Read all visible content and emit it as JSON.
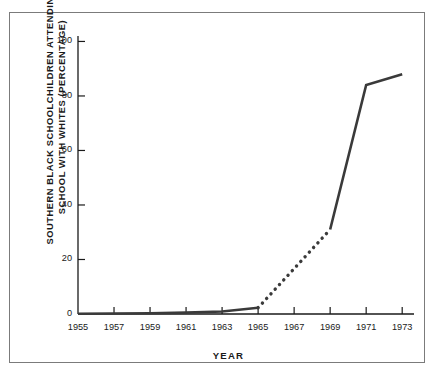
{
  "chart_data": {
    "type": "line",
    "title": "",
    "xlabel": "YEAR",
    "ylabel": "SOUTHERN BLACK SCHOOLCHILDREN ATTENDING SCHOOL WITH WHITES (PERCENTAGE)",
    "ylabel_lines": [
      "SOUTHERN BLACK SCHOOLCHILDREN ATTENDING",
      "SCHOOL WITH WHITES (PERCENTAGE)"
    ],
    "xlim": [
      1955,
      1973.6
    ],
    "ylim": [
      0,
      102
    ],
    "grid": false,
    "legend": null,
    "xticks": [
      1955,
      1957,
      1959,
      1961,
      1963,
      1965,
      1967,
      1969,
      1971,
      1973
    ],
    "xtick_labels": [
      "1955",
      "1957",
      "1959",
      "1961",
      "1963",
      "1965",
      "1967",
      "1969",
      "1971",
      "1973"
    ],
    "yticks": [
      0,
      20,
      40,
      60,
      80,
      100
    ],
    "ytick_labels": [
      "0",
      "20",
      "40",
      "60",
      "80",
      "100"
    ],
    "x": [
      1955,
      1957,
      1959,
      1961,
      1963,
      1965,
      1969,
      1971,
      1973
    ],
    "values": [
      0.1,
      0.2,
      0.3,
      0.5,
      0.9,
      2.3,
      31,
      84,
      88
    ],
    "series": [
      {
        "name": "Southern black schoolchildren attending school with whites",
        "x": [
          1955,
          1957,
          1959,
          1961,
          1963,
          1965,
          1969,
          1971,
          1973
        ],
        "values": [
          0.1,
          0.2,
          0.3,
          0.5,
          0.9,
          2.3,
          31,
          84,
          88
        ],
        "color": "#3a3a3a",
        "segments": [
          {
            "style": "solid",
            "x": [
              1955,
              1957,
              1959,
              1961,
              1963,
              1965
            ],
            "values": [
              0.1,
              0.2,
              0.3,
              0.5,
              0.9,
              2.3
            ]
          },
          {
            "style": "dotted",
            "x": [
              1965,
              1969
            ],
            "values": [
              2.3,
              31
            ]
          },
          {
            "style": "solid",
            "x": [
              1969,
              1971,
              1973
            ],
            "values": [
              31,
              84,
              88
            ]
          }
        ]
      }
    ],
    "colors": {
      "line": "#3a3a3a",
      "axis": "#1a1a1a",
      "frame": "#7b7b7b",
      "background": "#ffffff",
      "text": "#1a1a1a"
    }
  }
}
